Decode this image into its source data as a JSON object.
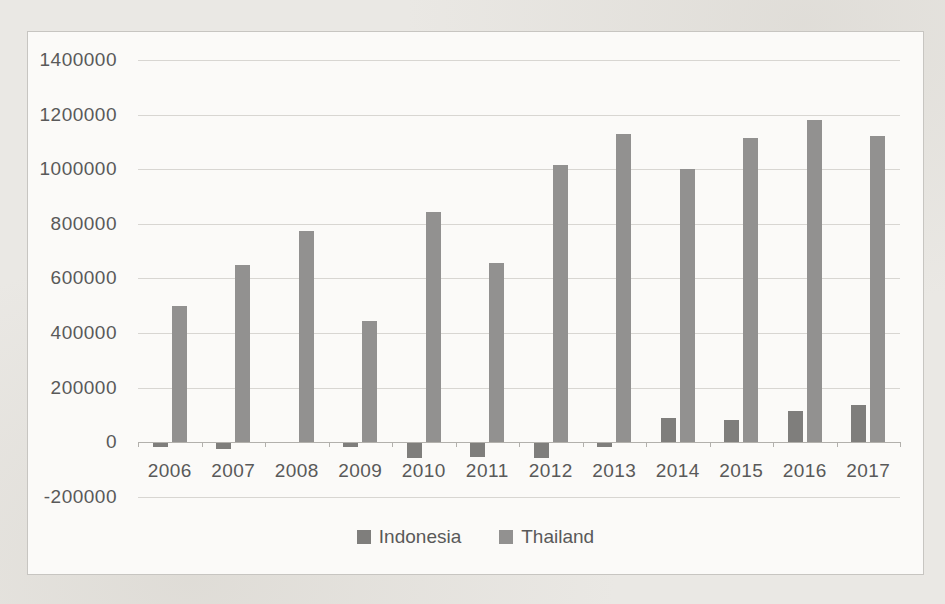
{
  "page": {
    "background_color": "#eae8e4"
  },
  "chart_frame": {
    "background_color": "#fbfaf8",
    "border_color": "#c7c5c1",
    "gridline_color": "#d8d6d2",
    "axis_line_color": "#b2b0ac",
    "label_color": "#595959"
  },
  "chart_data": {
    "type": "bar",
    "title": "",
    "xlabel": "",
    "ylabel": "",
    "categories": [
      "2006",
      "2007",
      "2008",
      "2009",
      "2010",
      "2011",
      "2012",
      "2013",
      "2014",
      "2015",
      "2016",
      "2017"
    ],
    "series": [
      {
        "name": "Indonesia",
        "color": "#7f7e7c",
        "values": [
          -15000,
          -20000,
          0,
          -15000,
          -55000,
          -50000,
          -55000,
          -15000,
          90000,
          80000,
          115000,
          135000
        ]
      },
      {
        "name": "Thailand",
        "color": "#929190",
        "values": [
          500000,
          650000,
          775000,
          445000,
          845000,
          655000,
          1015000,
          1130000,
          1000000,
          1115000,
          1180000,
          1120000
        ]
      }
    ],
    "ylim": [
      -200000,
      1400000
    ],
    "ytick_step": 200000,
    "yticks": [
      1400000,
      1200000,
      1000000,
      800000,
      600000,
      400000,
      200000,
      0,
      -200000
    ],
    "ytick_labels": [
      "1400000",
      "1200000",
      "1000000",
      "800000",
      "600000",
      "400000",
      "200000",
      "0",
      "-200000"
    ],
    "grid": true,
    "legend_position": "bottom"
  }
}
